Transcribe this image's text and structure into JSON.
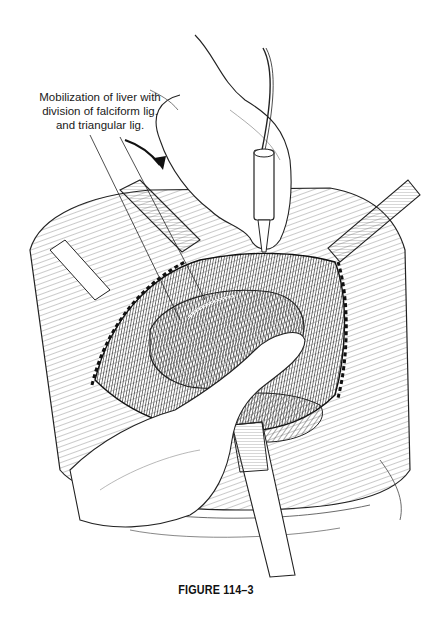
{
  "figure": {
    "annotation_lines": [
      "Mobilization of liver with",
      "division of falciform lig.",
      "and triangular lig."
    ],
    "caption": "FIGURE 114–3",
    "colors": {
      "background": "#ffffff",
      "ink": "#1a1a1a",
      "hatch": "#555555"
    },
    "elements": [
      "surgeon-hand-upper",
      "electrocautery-pencil",
      "curved-arrow",
      "retractor-left",
      "retractor-right",
      "retractor-bottom",
      "liver",
      "assistant-hand-lower",
      "abdominal-wall-incision"
    ]
  }
}
